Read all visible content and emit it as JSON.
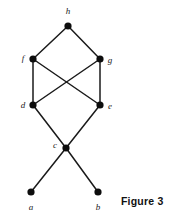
{
  "figure": {
    "caption": "Figure 3",
    "caption_x": 121,
    "caption_y": 195,
    "background_color": "#ffffff",
    "edge_color": "#1a1a1a",
    "node_color": "#0d0d0d",
    "label_color": "#1a1a1a",
    "node_radius": 3.6,
    "edge_width": 1.5
  },
  "graph": {
    "type": "undirected-graph",
    "nodes": [
      {
        "id": "h",
        "label": "h",
        "x": 68,
        "y": 26,
        "label_x": 68,
        "label_y": 14
      },
      {
        "id": "f",
        "label": "f",
        "x": 33,
        "y": 59,
        "label_x": 23,
        "label_y": 61
      },
      {
        "id": "g",
        "label": "g",
        "x": 100,
        "y": 59,
        "label_x": 110,
        "label_y": 63
      },
      {
        "id": "d",
        "label": "d",
        "x": 33,
        "y": 105,
        "label_x": 23,
        "label_y": 108
      },
      {
        "id": "e",
        "label": "e",
        "x": 100,
        "y": 105,
        "label_x": 110,
        "label_y": 109
      },
      {
        "id": "c",
        "label": "c",
        "x": 66,
        "y": 148,
        "label_x": 55,
        "label_y": 148
      },
      {
        "id": "a",
        "label": "a",
        "x": 31,
        "y": 192,
        "label_x": 31,
        "label_y": 210
      },
      {
        "id": "b",
        "label": "b",
        "x": 98,
        "y": 192,
        "label_x": 98,
        "label_y": 210
      }
    ],
    "edges": [
      {
        "from": "h",
        "to": "f"
      },
      {
        "from": "h",
        "to": "g"
      },
      {
        "from": "f",
        "to": "d"
      },
      {
        "from": "f",
        "to": "e"
      },
      {
        "from": "g",
        "to": "d"
      },
      {
        "from": "g",
        "to": "e"
      },
      {
        "from": "d",
        "to": "c"
      },
      {
        "from": "e",
        "to": "c"
      },
      {
        "from": "c",
        "to": "a"
      },
      {
        "from": "c",
        "to": "b"
      }
    ]
  }
}
